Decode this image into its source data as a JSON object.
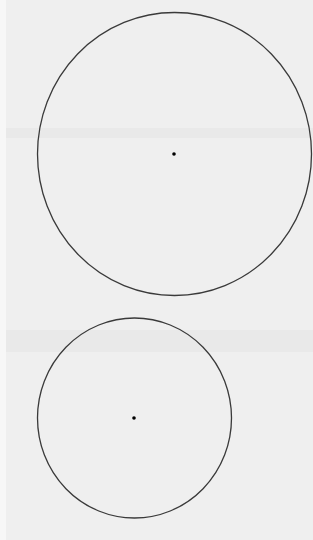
{
  "page": {
    "background": "#efefef",
    "margin_strip_color": "#f7f7f7"
  },
  "figure": {
    "stroke_color": "#3a3a3a",
    "dot_color": "#000000",
    "shapes": [
      {
        "name": "large-circle",
        "cx": 174.5,
        "cy": 154,
        "rx": 137,
        "ry": 141.5,
        "center_dot": {
          "cx": 174,
          "cy": 154,
          "r": 1.8
        }
      },
      {
        "name": "small-circle",
        "cx": 134.5,
        "cy": 418,
        "rx": 97,
        "ry": 100,
        "center_dot": {
          "cx": 134,
          "cy": 418,
          "r": 1.8
        }
      }
    ]
  },
  "bands": [
    {
      "top": 128,
      "height": 10
    },
    {
      "top": 330,
      "height": 22
    }
  ]
}
